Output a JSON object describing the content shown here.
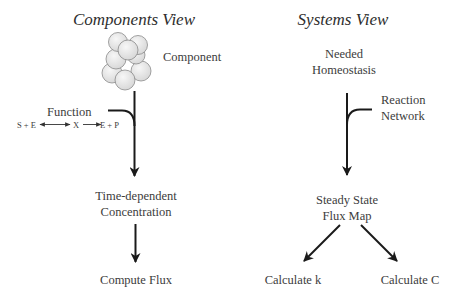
{
  "components_view": {
    "title": "Components View",
    "component_label": "Component",
    "function_label": "Function",
    "reaction": {
      "s_e": "S + E",
      "x": "X",
      "e_p": "E + P"
    },
    "step1": [
      "Time-dependent",
      "Concentration"
    ],
    "step2": "Compute Flux"
  },
  "systems_view": {
    "title": "Systems View",
    "start": [
      "Needed",
      "Homeostasis"
    ],
    "input_label": [
      "Reaction",
      "Network"
    ],
    "step1": [
      "Steady State",
      "Flux Map"
    ],
    "outputs": [
      "Calculate k",
      "Calculate C"
    ]
  },
  "colors": {
    "line": "#1a1a1a",
    "text": "#3c3c3c",
    "sphere_fill": "#e6e6e6",
    "sphere_stroke": "#8a8a8a"
  }
}
